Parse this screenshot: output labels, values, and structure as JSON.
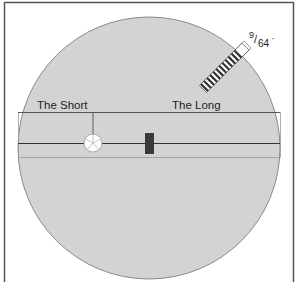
{
  "diagram": {
    "labels": {
      "short": "The Short",
      "long": "The Long"
    },
    "measurement": {
      "numerator": "9",
      "slash": "/",
      "denominator": "64",
      "unit": "\""
    },
    "colors": {
      "disc": "#d3d3d3",
      "disc_stroke": "#8a8a8a",
      "frame": "#555555",
      "line": "#333333",
      "marker": "#3a3a3a",
      "hole": "#ffffff"
    }
  }
}
